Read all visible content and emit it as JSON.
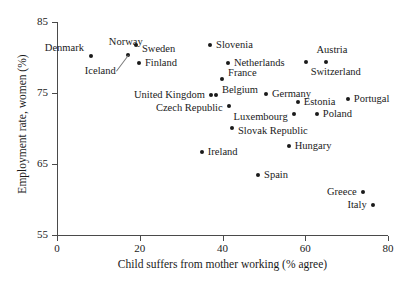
{
  "chart_data": {
    "type": "scatter",
    "title": "",
    "xlabel": "Child suffers from mother working (% agree)",
    "ylabel": "Employment rate, women (%)",
    "xlim": [
      0,
      80
    ],
    "ylim": [
      55,
      85
    ],
    "xticks": [
      0,
      20,
      40,
      60,
      80
    ],
    "yticks": [
      55,
      65,
      75,
      85
    ],
    "xticklabels": [
      "0",
      "20",
      "40",
      "60",
      "80"
    ],
    "yticklabels": [
      "55",
      "65",
      "75",
      "85"
    ],
    "grid": false,
    "legend": null,
    "marker_color": "#1a1a1a",
    "axis_color": "#4a4a4a",
    "points": [
      {
        "label": "Denmark",
        "x": 8.2,
        "y": 80.2,
        "label_pos": "left",
        "dx": -7,
        "dy": -8
      },
      {
        "label": "Norway",
        "x": 17.1,
        "y": 80.4,
        "label_pos": "above",
        "dx": -2,
        "dy": -8
      },
      {
        "label": "Sweden",
        "x": 19.1,
        "y": 81.8,
        "label_pos": "right",
        "dx": 6,
        "dy": 4
      },
      {
        "label": "Finland",
        "x": 19.8,
        "y": 79.2,
        "label_pos": "right",
        "dx": 6,
        "dy": 0
      },
      {
        "label": "Iceland",
        "x": 17.1,
        "y": 80.4,
        "label_pos": "left",
        "dx": -12,
        "dy": 16,
        "leader": true
      },
      {
        "label": "Slovenia",
        "x": 37.0,
        "y": 81.8,
        "label_pos": "right",
        "dx": 6,
        "dy": 0
      },
      {
        "label": "Netherlands",
        "x": 41.3,
        "y": 79.2,
        "label_pos": "right",
        "dx": 6,
        "dy": 0
      },
      {
        "label": "France",
        "x": 39.9,
        "y": 77.0,
        "label_pos": "right",
        "dx": 6,
        "dy": -6
      },
      {
        "label": "Germany",
        "x": 50.5,
        "y": 74.9,
        "label_pos": "right",
        "dx": 6,
        "dy": 0
      },
      {
        "label": "Belgium",
        "x": 38.4,
        "y": 74.7,
        "label_pos": "right",
        "dx": 6,
        "dy": -5
      },
      {
        "label": "United Kingdom",
        "x": 37.2,
        "y": 74.7,
        "label_pos": "left",
        "dx": -6,
        "dy": 0
      },
      {
        "label": "Switzerland",
        "x": 60.1,
        "y": 79.4,
        "label_pos": "right",
        "dx": 5,
        "dy": 10
      },
      {
        "label": "Austria",
        "x": 65.0,
        "y": 79.4,
        "label_pos": "above",
        "dx": 6,
        "dy": -7
      },
      {
        "label": "Estonia",
        "x": 58.2,
        "y": 73.7,
        "label_pos": "right",
        "dx": 6,
        "dy": 0
      },
      {
        "label": "Portugal",
        "x": 70.3,
        "y": 74.2,
        "label_pos": "right",
        "dx": 6,
        "dy": 0
      },
      {
        "label": "Czech Republic",
        "x": 41.5,
        "y": 73.2,
        "label_pos": "left",
        "dx": -6,
        "dy": 2
      },
      {
        "label": "Luxembourg",
        "x": 57.2,
        "y": 72.0,
        "label_pos": "left",
        "dx": -6,
        "dy": 3
      },
      {
        "label": "Poland",
        "x": 62.8,
        "y": 72.0,
        "label_pos": "right",
        "dx": 6,
        "dy": 0
      },
      {
        "label": "Slovak Republic",
        "x": 42.3,
        "y": 70.1,
        "label_pos": "right",
        "dx": 6,
        "dy": 3
      },
      {
        "label": "Ireland",
        "x": 35.0,
        "y": 66.7,
        "label_pos": "right",
        "dx": 6,
        "dy": 0
      },
      {
        "label": "Hungary",
        "x": 56.0,
        "y": 67.5,
        "label_pos": "right",
        "dx": 6,
        "dy": 0
      },
      {
        "label": "Spain",
        "x": 48.6,
        "y": 63.5,
        "label_pos": "right",
        "dx": 6,
        "dy": 0
      },
      {
        "label": "Greece",
        "x": 73.9,
        "y": 61.1,
        "label_pos": "left",
        "dx": -6,
        "dy": 0
      },
      {
        "label": "Italy",
        "x": 76.3,
        "y": 59.2,
        "label_pos": "left",
        "dx": -6,
        "dy": 0
      }
    ]
  }
}
